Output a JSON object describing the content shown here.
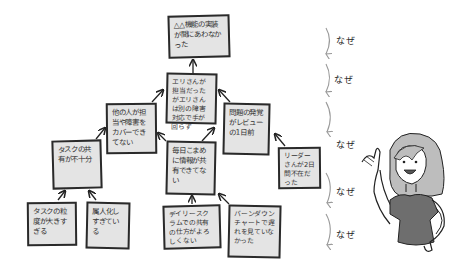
{
  "diagram": {
    "type": "why-why-analysis-tree",
    "root": {
      "id": "root",
      "text": "△△機能の実装が間にあわなかった"
    },
    "nodes": [
      {
        "id": "n1",
        "text": "エリさんが担当だったがエリさんは別の障害対応で手が回らず",
        "parent": "root"
      },
      {
        "id": "n2",
        "text": "他の人が担当や障害をカバーできてない",
        "parent": "n1"
      },
      {
        "id": "n3",
        "text": "問題の発覚がレビューの1日前",
        "parent": "n1"
      },
      {
        "id": "n4",
        "text": "タスクの共有が不十分",
        "parent": "n2"
      },
      {
        "id": "n5",
        "text": "毎日こまめに情報が共有できてない",
        "parent": "n2"
      },
      {
        "id": "n6",
        "text": "リーダーさんが2日間不在だった",
        "parent": "n3"
      },
      {
        "id": "n7",
        "text": "タスクの粒度が大きすぎる",
        "parent": "n4"
      },
      {
        "id": "n8",
        "text": "属人化しすぎている",
        "parent": "n4"
      },
      {
        "id": "n9",
        "text": "デイリースクラムでの共有の仕方がよろしくない",
        "parent": "n5"
      },
      {
        "id": "n10",
        "text": "バーンダウンチャートで遅れを見ていなかった",
        "parent": "n5"
      }
    ],
    "why_labels": [
      "なぜ",
      "なぜ",
      "なぜ",
      "なぜ",
      "なぜ"
    ],
    "character": "woman-pointing-illustration"
  },
  "colors": {
    "box_fill": "#e4e4e4",
    "box_border": "#2a2a2a",
    "why_arrow": "#999999",
    "shirt": "#6e6e6e",
    "hair": "#bdbdbd"
  }
}
